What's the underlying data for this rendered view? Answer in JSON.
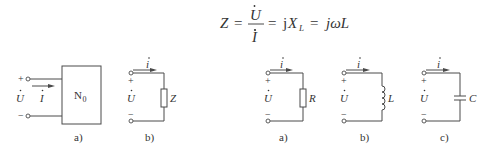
{
  "formula": {
    "lhs": "Z",
    "eq1": "=",
    "numerator": "U",
    "denominator": "I",
    "eq2": "=",
    "mid_j": "j",
    "mid_X": "X",
    "mid_sub": "L",
    "eq3": "=",
    "rhs": "jωL"
  },
  "left_group": {
    "network": {
      "box_label": "N",
      "box_sub": "0",
      "plus": "+",
      "minus": "−",
      "voltage": "U",
      "current": "I",
      "caption": "a)"
    },
    "impedance": {
      "plus": "+",
      "minus": "−",
      "voltage": "U",
      "current": "i",
      "element_label": "Z",
      "caption": "b)"
    }
  },
  "right_group": {
    "resistor": {
      "plus": "+",
      "minus": "−",
      "voltage": "U",
      "current": "i",
      "element_label": "R",
      "caption": "a)"
    },
    "inductor": {
      "plus": "+",
      "minus": "−",
      "voltage": "U",
      "current": "i",
      "element_label": "L",
      "caption": "b)"
    },
    "capacitor": {
      "plus": "+",
      "minus": "−",
      "voltage": "U",
      "current": "i",
      "element_label": "C",
      "caption": "c)"
    }
  },
  "colors": {
    "line": "#4a4a4a",
    "text": "#333333",
    "background": "#ffffff"
  }
}
